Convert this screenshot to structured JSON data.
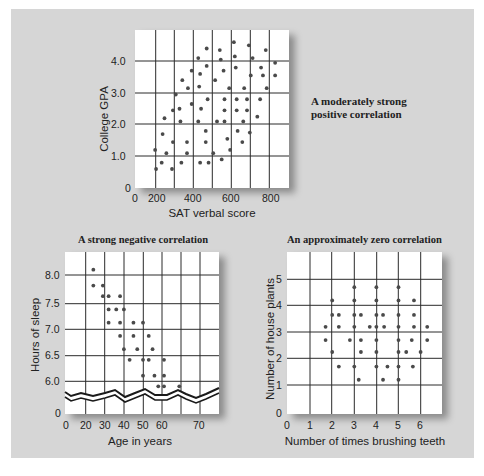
{
  "chart_data": [
    {
      "type": "scatter",
      "id": "sat-gpa",
      "title": "",
      "caption": "A moderately strong positive correlation",
      "xlabel": "SAT verbal score",
      "ylabel": "College GPA",
      "xticks": [
        "0",
        "200",
        "400",
        "600",
        "800"
      ],
      "yticks": [
        "0",
        "1.0",
        "2.0",
        "3.0",
        "4.0"
      ],
      "xlim": [
        0,
        850
      ],
      "ylim": [
        0,
        4.6
      ],
      "grid": true,
      "points": [
        [
          190,
          1.2
        ],
        [
          195,
          0.6
        ],
        [
          225,
          0.8
        ],
        [
          230,
          1.7
        ],
        [
          240,
          2.2
        ],
        [
          250,
          1.1
        ],
        [
          280,
          0.6
        ],
        [
          285,
          1.45
        ],
        [
          285,
          2.45
        ],
        [
          300,
          2.95
        ],
        [
          320,
          2.5
        ],
        [
          325,
          2.1
        ],
        [
          330,
          0.8
        ],
        [
          335,
          3.4
        ],
        [
          360,
          1.45
        ],
        [
          360,
          1.1
        ],
        [
          365,
          3.15
        ],
        [
          385,
          3.7
        ],
        [
          385,
          2.65
        ],
        [
          420,
          4.1
        ],
        [
          420,
          2.1
        ],
        [
          425,
          3.2
        ],
        [
          430,
          3.6
        ],
        [
          430,
          0.8
        ],
        [
          435,
          2.5
        ],
        [
          460,
          1.8
        ],
        [
          460,
          1.45
        ],
        [
          465,
          4.4
        ],
        [
          465,
          3.85
        ],
        [
          470,
          2.8
        ],
        [
          475,
          0.8
        ],
        [
          500,
          1.1
        ],
        [
          510,
          3.4
        ],
        [
          520,
          2.1
        ],
        [
          535,
          4.35
        ],
        [
          540,
          4.05
        ],
        [
          545,
          0.9
        ],
        [
          555,
          3.7
        ],
        [
          560,
          2.8
        ],
        [
          560,
          2.45
        ],
        [
          560,
          2.1
        ],
        [
          575,
          1.55
        ],
        [
          585,
          3.15
        ],
        [
          590,
          1.2
        ],
        [
          610,
          4.6
        ],
        [
          615,
          4.15
        ],
        [
          620,
          3.8
        ],
        [
          625,
          2.8
        ],
        [
          625,
          2.45
        ],
        [
          630,
          1.8
        ],
        [
          655,
          1.45
        ],
        [
          660,
          2.1
        ],
        [
          665,
          3.15
        ],
        [
          680,
          2.8
        ],
        [
          680,
          2.45
        ],
        [
          690,
          4.5
        ],
        [
          695,
          1.75
        ],
        [
          700,
          3.55
        ],
        [
          710,
          4.1
        ],
        [
          735,
          2.25
        ],
        [
          750,
          2.8
        ],
        [
          755,
          3.8
        ],
        [
          765,
          3.55
        ],
        [
          780,
          4.35
        ],
        [
          785,
          3.15
        ],
        [
          830,
          3.95
        ],
        [
          830,
          3.55
        ]
      ]
    },
    {
      "type": "scatter",
      "id": "age-sleep",
      "title": "A strong negative correlation",
      "xlabel": "Age in years",
      "ylabel": "Hours of sleep",
      "xticks": [
        "0",
        "20",
        "30",
        "40",
        "50",
        "60",
        "70"
      ],
      "yticks": [
        "0",
        "6.0",
        "6.5",
        "7.0",
        "7.5",
        "8.0"
      ],
      "xlim": [
        10,
        80
      ],
      "ylim": [
        5.7,
        8.4
      ],
      "axis_break": true,
      "grid": true,
      "points": [
        [
          24,
          8.1
        ],
        [
          24,
          7.8
        ],
        [
          29,
          7.8
        ],
        [
          29,
          7.6
        ],
        [
          32,
          7.6
        ],
        [
          32,
          7.35
        ],
        [
          32,
          7.1
        ],
        [
          36,
          7.35
        ],
        [
          38,
          7.6
        ],
        [
          38,
          7.1
        ],
        [
          38,
          6.85
        ],
        [
          40,
          7.35
        ],
        [
          40,
          6.6
        ],
        [
          43,
          6.4
        ],
        [
          45,
          7.1
        ],
        [
          45,
          6.85
        ],
        [
          47,
          6.6
        ],
        [
          50,
          7.1
        ],
        [
          50,
          6.4
        ],
        [
          50,
          6.1
        ],
        [
          53,
          6.85
        ],
        [
          53,
          6.4
        ],
        [
          55,
          6.6
        ],
        [
          56,
          6.1
        ],
        [
          58,
          5.9
        ],
        [
          61,
          6.4
        ],
        [
          61,
          6.1
        ],
        [
          61,
          5.9
        ],
        [
          69,
          5.9
        ]
      ]
    },
    {
      "type": "scatter",
      "id": "teeth-plants",
      "title": "An approximately zero correlation",
      "xlabel": "Number of times brushing teeth",
      "ylabel": "Number of house plants",
      "xticks": [
        "0",
        "1",
        "2",
        "3",
        "4",
        "5",
        "6"
      ],
      "yticks": [
        "0",
        "1",
        "2",
        "3",
        "4",
        "5"
      ],
      "xlim": [
        0,
        7
      ],
      "ylim": [
        0,
        6
      ],
      "grid": true,
      "points": [
        [
          1.7,
          3.2
        ],
        [
          1.7,
          2.7
        ],
        [
          2.0,
          4.2
        ],
        [
          2.0,
          3.65
        ],
        [
          2.0,
          2.25
        ],
        [
          2.3,
          3.65
        ],
        [
          2.3,
          3.2
        ],
        [
          2.3,
          1.7
        ],
        [
          2.8,
          2.7
        ],
        [
          3.0,
          4.7
        ],
        [
          3.0,
          4.2
        ],
        [
          3.0,
          3.65
        ],
        [
          3.0,
          3.2
        ],
        [
          3.0,
          1.7
        ],
        [
          3.2,
          1.2
        ],
        [
          3.3,
          3.65
        ],
        [
          3.3,
          2.7
        ],
        [
          3.3,
          2.25
        ],
        [
          3.7,
          3.2
        ],
        [
          4.0,
          4.7
        ],
        [
          4.0,
          4.2
        ],
        [
          4.0,
          3.65
        ],
        [
          4.0,
          3.2
        ],
        [
          4.0,
          2.7
        ],
        [
          4.0,
          2.25
        ],
        [
          4.0,
          1.7
        ],
        [
          4.3,
          3.65
        ],
        [
          4.3,
          1.2
        ],
        [
          4.35,
          3.2
        ],
        [
          4.5,
          1.7
        ],
        [
          5.0,
          4.7
        ],
        [
          5.0,
          4.2
        ],
        [
          5.0,
          3.65
        ],
        [
          5.0,
          3.2
        ],
        [
          5.0,
          2.7
        ],
        [
          5.0,
          2.25
        ],
        [
          5.0,
          1.7
        ],
        [
          5.0,
          1.2
        ],
        [
          5.35,
          2.25
        ],
        [
          5.6,
          2.7
        ],
        [
          5.65,
          1.7
        ],
        [
          5.7,
          4.2
        ],
        [
          5.7,
          3.65
        ],
        [
          5.7,
          3.2
        ],
        [
          6.0,
          2.25
        ],
        [
          6.3,
          3.2
        ],
        [
          6.3,
          2.7
        ]
      ]
    }
  ],
  "colors": {
    "panel": "#d6d6d6",
    "plot_bg": "#ffffff",
    "grid": "#2a2a2a",
    "dot": "#4a4a4a",
    "text": "#222222"
  }
}
